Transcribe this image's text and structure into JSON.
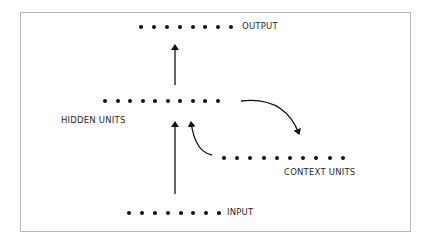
{
  "diagram": {
    "colors": {
      "frame": "#b8b8b8",
      "ink": "#111111",
      "text": "#2a2a2a"
    },
    "layers": {
      "output": {
        "label": "OUTPUT",
        "units": 8
      },
      "hidden": {
        "label": "HIDDEN UNITS",
        "units": 10
      },
      "context": {
        "label": "CONTEXT UNITS",
        "units": 10
      },
      "input": {
        "label": "INPUT",
        "units": 8
      }
    },
    "connections": [
      {
        "from": "input",
        "to": "hidden",
        "type": "straight-arrow"
      },
      {
        "from": "hidden",
        "to": "output",
        "type": "straight-arrow"
      },
      {
        "from": "hidden",
        "to": "context",
        "type": "curved-arrow"
      },
      {
        "from": "context",
        "to": "hidden",
        "type": "curved-arrow"
      }
    ]
  }
}
